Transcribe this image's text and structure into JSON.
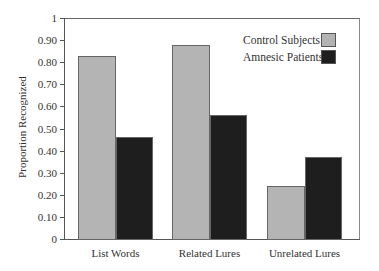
{
  "chart_data": {
    "type": "bar",
    "title": "",
    "xlabel": "",
    "ylabel": "Proportion Recognized",
    "ylim": [
      0,
      1
    ],
    "yticks": [
      0,
      0.1,
      0.2,
      0.3,
      0.4,
      0.5,
      0.6,
      0.7,
      0.8,
      0.9,
      1
    ],
    "ytick_labels": [
      "0",
      "0.10",
      "0.20",
      "0.30",
      "0.40",
      "0.50",
      "0.60",
      "0.70",
      "0.80",
      "0.90",
      "1"
    ],
    "categories": [
      "List Words",
      "Related Lures",
      "Unrelated Lures"
    ],
    "series": [
      {
        "name": "Control Subjects",
        "color": "#b4b4b4",
        "values": [
          0.83,
          0.88,
          0.24
        ]
      },
      {
        "name": "Amnesic Patients",
        "color": "#1e1e1e",
        "values": [
          0.46,
          0.56,
          0.37
        ]
      }
    ],
    "grid": false,
    "legend_position": "upper right (inside plot)"
  }
}
